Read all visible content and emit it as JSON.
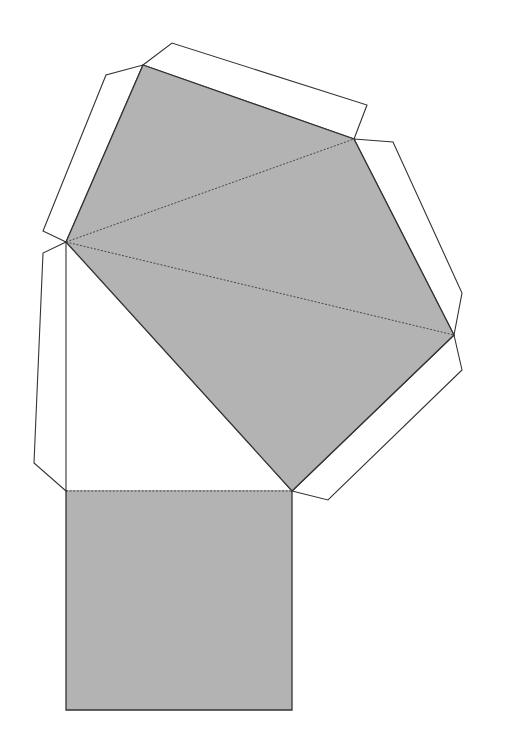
{
  "diagram": {
    "type": "paper-net",
    "colors": {
      "face_fill": "#b3b3b3",
      "outline": "#333333",
      "tab_fill": "#ffffff",
      "background": "#ffffff"
    },
    "pentagon": [
      [
        143,
        65
      ],
      [
        354,
        139
      ],
      [
        454,
        335
      ],
      [
        292,
        491
      ],
      [
        66,
        242
      ]
    ],
    "square": [
      [
        66,
        491
      ],
      [
        292,
        491
      ],
      [
        292,
        710
      ],
      [
        66,
        710
      ]
    ],
    "fold_lines": [
      [
        [
          66,
          242
        ],
        [
          354,
          139
        ]
      ],
      [
        [
          66,
          242
        ],
        [
          454,
          335
        ]
      ],
      [
        [
          66,
          242
        ],
        [
          292,
          491
        ]
      ],
      [
        [
          66,
          491
        ],
        [
          292,
          491
        ]
      ]
    ],
    "tabs": [
      [
        [
          143,
          65
        ],
        [
          172,
          43
        ],
        [
          367,
          105
        ],
        [
          354,
          139
        ]
      ],
      [
        [
          354,
          139
        ],
        [
          393,
          142
        ],
        [
          462,
          293
        ],
        [
          454,
          335
        ]
      ],
      [
        [
          454,
          335
        ],
        [
          462,
          370
        ],
        [
          328,
          500
        ],
        [
          292,
          491
        ]
      ],
      [
        [
          66,
          242
        ],
        [
          43,
          253
        ],
        [
          34,
          463
        ],
        [
          66,
          491
        ]
      ],
      [
        [
          66,
          242
        ],
        [
          43,
          231
        ],
        [
          106,
          75
        ],
        [
          143,
          65
        ]
      ]
    ]
  }
}
